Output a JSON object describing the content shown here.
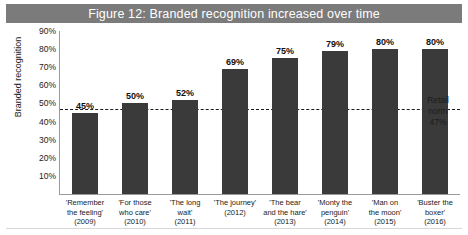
{
  "figure": {
    "title": "Figure 12: Branded recognition increased over time",
    "banner_color": "#7b7b7b",
    "bar_color": "#3a3a3a"
  },
  "chart_data": {
    "type": "bar",
    "title": "Figure 12: Branded recognition increased over time",
    "xlabel": "",
    "ylabel": "Branded recognition",
    "ylim": [
      0,
      90
    ],
    "grid": false,
    "legend": "none",
    "ytick_labels": [
      "90%",
      "80%",
      "70%",
      "60%",
      "50%",
      "40%",
      "30%",
      "20%",
      "10%"
    ],
    "ytick_values": [
      90,
      80,
      70,
      60,
      50,
      40,
      30,
      20,
      10
    ],
    "categories": [
      "'Remember the feeling' (2009)",
      "'For those who care' (2010)",
      "'The long wait' (2011)",
      "'The journey' (2012)",
      "'The bear and the hare' (2013)",
      "'Monty the penguin' (2014)",
      "'Man on the moon' (2015)",
      "'Buster the boxer' (2016)"
    ],
    "category_lines": [
      [
        "'Remember",
        "the feeling'",
        "(2009)"
      ],
      [
        "'For those",
        "who care'",
        "(2010)"
      ],
      [
        "'The long",
        "wait'",
        "(2011)"
      ],
      [
        "'The journey'",
        "(2012)",
        ""
      ],
      [
        "'The bear",
        "and the hare'",
        "(2013)"
      ],
      [
        "'Monty the",
        "penguin'",
        "(2014)"
      ],
      [
        "'Man on",
        "the moon'",
        "(2015)"
      ],
      [
        "'Buster the",
        "boxer'",
        "(2016)"
      ]
    ],
    "values": [
      45,
      50,
      52,
      69,
      75,
      79,
      80,
      80
    ],
    "value_labels": [
      "45%",
      "50%",
      "52%",
      "69%",
      "75%",
      "79%",
      "80%",
      "80%"
    ],
    "reference_line": {
      "value": 47,
      "style": "dashed",
      "label_lines": [
        "Retail",
        "norm",
        "47%"
      ]
    }
  }
}
